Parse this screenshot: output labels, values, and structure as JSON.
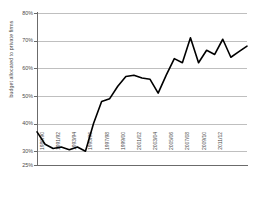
{
  "chart_data": {
    "type": "line",
    "title": "",
    "xlabel": "",
    "ylabel": "budget allocated to private firms",
    "ylim": [
      25,
      80
    ],
    "ytick_labels": [
      "25%",
      "30%",
      "40%",
      "50%",
      "60%",
      "70%",
      "80%"
    ],
    "ytick_values": [
      25,
      30,
      40,
      50,
      60,
      70,
      80
    ],
    "grid": true,
    "gridlines_at": [
      30,
      40,
      50,
      60,
      70,
      80
    ],
    "legend": "none",
    "line_color": "#000000",
    "line_width": 1.6,
    "categories": [
      "1989/90",
      "1990/91",
      "1991/92",
      "1992/93",
      "1993/94",
      "1994/95",
      "1995/96",
      "1996/97",
      "1997/98",
      "1998/99",
      "1999/00",
      "2000/01",
      "2001/02",
      "2002/03",
      "2003/04",
      "2004/05",
      "2005/06",
      "2006/07",
      "2007/08",
      "2008/09",
      "2009/10",
      "2010/11",
      "2011/12"
    ],
    "xtick_labels": [
      "1989/90",
      "1991/92",
      "1993/94",
      "1995/96",
      "1997/98",
      "1999/00",
      "2001/02",
      "2003/04",
      "2005/06",
      "2007/08",
      "2009/10",
      "2011/12"
    ],
    "values": [
      37.0,
      32.5,
      31.0,
      31.5,
      30.5,
      31.5,
      30.0,
      40.0,
      48.0,
      49.0,
      53.5,
      57.0,
      57.5,
      56.5,
      56.0,
      51.0,
      57.5,
      63.5,
      62.0,
      71.0,
      62.0,
      66.5,
      65.0
    ],
    "values_tail": [
      70.5,
      64.0,
      66.0,
      68.0
    ]
  }
}
